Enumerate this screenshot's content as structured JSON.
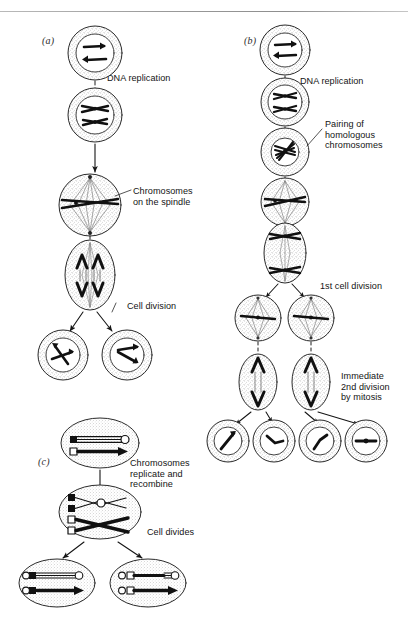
{
  "figure": {
    "background": "#ffffff",
    "ink": "#141414",
    "width": 408,
    "height": 630
  },
  "panels": [
    {
      "id": "a",
      "label": "(a)",
      "name": "mitosis",
      "label_x": 42,
      "label_y": 35,
      "stages": [
        {
          "name": "interphase-diploid-cell",
          "shape": "circle",
          "cx": 95,
          "cy": 53,
          "rx": 27,
          "ry": 24,
          "content": "two unreplicated chromosomes"
        },
        {
          "name": "replicated-chromosomes-cell",
          "shape": "circle",
          "cx": 95,
          "cy": 115,
          "rx": 27,
          "ry": 25,
          "content": "two replicated chromosomes"
        },
        {
          "name": "metaphase-spindle-cell",
          "shape": "circle",
          "cx": 90,
          "cy": 205,
          "rx": 31,
          "ry": 28,
          "content": "chromosomes aligned on spindle"
        },
        {
          "name": "anaphase-cell",
          "shape": "ellipse",
          "cx": 90,
          "cy": 275,
          "rx": 25,
          "ry": 35,
          "content": "chromatids pulled to poles"
        },
        {
          "name": "daughter-cell-left",
          "shape": "circle",
          "cx": 63,
          "cy": 355,
          "rx": 25,
          "ry": 23,
          "content": "diploid daughter cell"
        },
        {
          "name": "daughter-cell-right",
          "shape": "circle",
          "cx": 127,
          "cy": 355,
          "rx": 25,
          "ry": 23,
          "content": "diploid daughter cell"
        }
      ],
      "captions": [
        {
          "name": "caption-dna-replication",
          "text": "DNA replication",
          "x": 107,
          "y": 73
        },
        {
          "name": "caption-chromosomes-on-the-spindle",
          "text": "Chromosomes\non the spindle",
          "x": 133,
          "y": 186
        },
        {
          "name": "caption-cell-division",
          "text": "Cell division",
          "x": 127,
          "y": 301
        }
      ]
    },
    {
      "id": "b",
      "label": "(b)",
      "name": "meiosis",
      "label_x": 244,
      "label_y": 35,
      "stages": [
        {
          "name": "interphase-diploid-cell",
          "shape": "circle",
          "cx": 285,
          "cy": 50,
          "rx": 25,
          "ry": 23,
          "content": "two unreplicated chromosomes"
        },
        {
          "name": "replicated-chromosomes-cell",
          "shape": "circle",
          "cx": 285,
          "cy": 102,
          "rx": 24,
          "ry": 22,
          "content": "two replicated chromosomes"
        },
        {
          "name": "paired-homologues-cell",
          "shape": "circle",
          "cx": 285,
          "cy": 152,
          "rx": 24,
          "ry": 22,
          "content": "paired homologous chromosomes"
        },
        {
          "name": "metaphase-i-cell",
          "shape": "circle",
          "cx": 285,
          "cy": 202,
          "rx": 24,
          "ry": 22,
          "content": "bivalents on spindle"
        },
        {
          "name": "anaphase-i-cell",
          "shape": "ellipse",
          "cx": 285,
          "cy": 253,
          "rx": 21,
          "ry": 30,
          "content": "homologues separating"
        },
        {
          "name": "meiosis-i-daughter-left",
          "shape": "circle",
          "cx": 258,
          "cy": 318,
          "rx": 23,
          "ry": 21,
          "content": "haploid cell entering 2nd division"
        },
        {
          "name": "meiosis-i-daughter-right",
          "shape": "circle",
          "cx": 311,
          "cy": 318,
          "rx": 23,
          "ry": 21,
          "content": "haploid cell entering 2nd division"
        },
        {
          "name": "anaphase-ii-cell-left",
          "shape": "ellipse",
          "cx": 258,
          "cy": 382,
          "rx": 19,
          "ry": 28,
          "content": "chromatids separating"
        },
        {
          "name": "anaphase-ii-cell-right",
          "shape": "ellipse",
          "cx": 311,
          "cy": 382,
          "rx": 19,
          "ry": 28,
          "content": "chromatids separating"
        },
        {
          "name": "gamete-cell-1",
          "shape": "circle",
          "cx": 228,
          "cy": 441,
          "rx": 21,
          "ry": 20,
          "content": "haploid gamete"
        },
        {
          "name": "gamete-cell-2",
          "shape": "circle",
          "cx": 274,
          "cy": 441,
          "rx": 21,
          "ry": 20,
          "content": "haploid gamete"
        },
        {
          "name": "gamete-cell-3",
          "shape": "circle",
          "cx": 320,
          "cy": 441,
          "rx": 21,
          "ry": 20,
          "content": "haploid gamete"
        },
        {
          "name": "gamete-cell-4",
          "shape": "circle",
          "cx": 366,
          "cy": 441,
          "rx": 21,
          "ry": 20,
          "content": "haploid gamete"
        }
      ],
      "captions": [
        {
          "name": "caption-dna-replication",
          "text": "DNA replication",
          "x": 300,
          "y": 76
        },
        {
          "name": "caption-pairing-of-homologous-chromosomes",
          "text": "Pairing of\nhomologous\nchromosomes",
          "x": 325,
          "y": 119
        },
        {
          "name": "caption-1st-cell-division",
          "text": "1st cell division",
          "x": 320,
          "y": 281
        },
        {
          "name": "caption-immediate-2nd-division-by-mitosis",
          "text": "Immediate\n2nd division\nby mitosis",
          "x": 341,
          "y": 371
        }
      ]
    },
    {
      "id": "c",
      "label": "(c)",
      "name": "recombination",
      "label_x": 38,
      "label_y": 456,
      "stages": [
        {
          "name": "parent-cell-two-homologues",
          "shape": "ellipse",
          "cx": 100,
          "cy": 443,
          "rx": 39,
          "ry": 25,
          "content": "one white and one black chromosome"
        },
        {
          "name": "recombination-cell",
          "shape": "ellipse",
          "cx": 100,
          "cy": 512,
          "rx": 41,
          "ry": 27,
          "content": "replicated chromosomes crossing over"
        },
        {
          "name": "recombinant-daughter-left",
          "shape": "ellipse",
          "cx": 57,
          "cy": 583,
          "rx": 38,
          "ry": 24,
          "content": "recombinant chromosomes"
        },
        {
          "name": "recombinant-daughter-right",
          "shape": "ellipse",
          "cx": 148,
          "cy": 583,
          "rx": 38,
          "ry": 24,
          "content": "recombinant chromosomes"
        }
      ],
      "captions": [
        {
          "name": "caption-chromosomes-replicate-and-recombine",
          "text": "Chromosomes\nreplicate and\nrecombine",
          "x": 130,
          "y": 458
        },
        {
          "name": "caption-cell-divides",
          "text": "Cell divides",
          "x": 147,
          "y": 527
        }
      ]
    }
  ]
}
